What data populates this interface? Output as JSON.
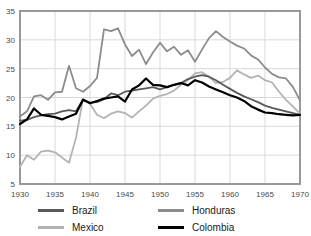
{
  "chart_data": {
    "type": "line",
    "title": "",
    "xlabel": "",
    "ylabel": "",
    "xlim": [
      1930,
      1970
    ],
    "ylim": [
      5,
      35
    ],
    "grid": true,
    "legend_position": "bottom",
    "xticks": [
      1930,
      1935,
      1940,
      1945,
      1950,
      1955,
      1960,
      1965,
      1970
    ],
    "yticks": [
      5,
      10,
      15,
      20,
      25,
      30,
      35
    ],
    "xtick_labels": [
      "1930",
      "1935",
      "1940",
      "1945",
      "1950",
      "1955",
      "1960",
      "1965",
      "1970"
    ],
    "ytick_labels": [
      "5",
      "10",
      "15",
      "20",
      "25",
      "30",
      "35"
    ],
    "x": [
      1930,
      1931,
      1932,
      1933,
      1934,
      1935,
      1936,
      1937,
      1938,
      1939,
      1940,
      1941,
      1942,
      1943,
      1944,
      1945,
      1946,
      1947,
      1948,
      1949,
      1950,
      1951,
      1952,
      1953,
      1954,
      1955,
      1956,
      1957,
      1958,
      1959,
      1960,
      1961,
      1962,
      1963,
      1964,
      1965,
      1966,
      1967,
      1968,
      1969,
      1970
    ],
    "series": [
      {
        "name": "Brazil",
        "color": "#595959",
        "values": [
          16.0,
          16.1,
          16.6,
          16.9,
          17.1,
          17.2,
          17.6,
          17.8,
          17.6,
          19.6,
          19.1,
          19.2,
          19.7,
          20.7,
          20.4,
          21.0,
          21.2,
          21.4,
          21.6,
          21.8,
          21.4,
          21.8,
          22.2,
          22.5,
          23.2,
          23.6,
          23.9,
          23.6,
          23.0,
          22.2,
          21.5,
          20.8,
          20.2,
          19.7,
          19.2,
          18.6,
          18.2,
          17.9,
          17.6,
          17.3,
          17.0
        ]
      },
      {
        "name": "Mexico",
        "color": "#b3b3b3",
        "values": [
          8.0,
          10.0,
          9.2,
          10.6,
          10.8,
          10.5,
          9.6,
          8.7,
          13.0,
          19.8,
          18.9,
          17.0,
          16.4,
          17.2,
          17.6,
          17.3,
          16.5,
          17.6,
          18.6,
          19.8,
          20.3,
          20.6,
          21.2,
          22.2,
          23.0,
          24.2,
          24.4,
          23.6,
          22.5,
          22.7,
          23.4,
          24.7,
          24.0,
          23.4,
          23.8,
          23.0,
          22.6,
          21.0,
          19.6,
          18.4,
          17.2
        ]
      },
      {
        "name": "Honduras",
        "color": "#8c8c8c",
        "values": [
          16.7,
          17.6,
          20.2,
          20.4,
          19.6,
          20.9,
          21.0,
          25.5,
          21.6,
          21.0,
          22.0,
          23.4,
          31.8,
          31.5,
          32.0,
          29.2,
          27.2,
          28.3,
          25.8,
          27.8,
          29.5,
          28.0,
          28.8,
          27.4,
          28.2,
          26.2,
          28.3,
          30.3,
          31.5,
          30.5,
          29.7,
          29.0,
          28.5,
          27.3,
          26.6,
          25.2,
          24.1,
          23.5,
          23.3,
          21.8,
          19.5
        ]
      },
      {
        "name": "Colombia",
        "color": "#000000",
        "values": [
          15.4,
          16.2,
          18.1,
          17.0,
          16.8,
          16.6,
          16.2,
          16.7,
          17.2,
          19.6,
          19.0,
          19.4,
          19.8,
          20.0,
          20.2,
          19.3,
          21.4,
          22.1,
          23.3,
          22.2,
          22.1,
          21.8,
          22.2,
          22.5,
          22.1,
          23.0,
          22.6,
          21.9,
          21.4,
          20.9,
          20.4,
          20.0,
          19.4,
          18.5,
          17.9,
          17.4,
          17.3,
          17.1,
          17.0,
          16.9,
          17.0
        ]
      }
    ]
  },
  "legend": {
    "entries": [
      {
        "label": "Brazil",
        "color": "#595959"
      },
      {
        "label": "Honduras",
        "color": "#8c8c8c"
      },
      {
        "label": "Mexico",
        "color": "#b3b3b3"
      },
      {
        "label": "Colombia",
        "color": "#000000"
      }
    ]
  },
  "axes": {
    "plot_border_color": "#999999",
    "gridline_color": "#d9d9d9",
    "background": "#ffffff"
  }
}
